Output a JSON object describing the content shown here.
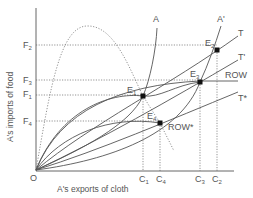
{
  "axes": {
    "x_title": "A's exports of cloth",
    "y_title": "A's imports of food",
    "origin": "O"
  },
  "y_ticks": [
    {
      "base": "F",
      "sub": "2"
    },
    {
      "base": "F",
      "sub": "3"
    },
    {
      "base": "F",
      "sub": "1"
    },
    {
      "base": "F",
      "sub": "4"
    }
  ],
  "x_ticks": [
    {
      "base": "C",
      "sub": "1"
    },
    {
      "base": "C",
      "sub": "4"
    },
    {
      "base": "C",
      "sub": "3"
    },
    {
      "base": "C",
      "sub": "2"
    }
  ],
  "curves": {
    "A": "A",
    "A_prime": "A'",
    "T": "T",
    "T_prime": "T'",
    "ROW": "ROW",
    "T_star": "T*",
    "ROW_star": "ROW*"
  },
  "points": [
    {
      "base": "E",
      "sub": "1"
    },
    {
      "base": "E",
      "sub": "2"
    },
    {
      "base": "E",
      "sub": "3"
    },
    {
      "base": "E",
      "sub": "4"
    }
  ]
}
